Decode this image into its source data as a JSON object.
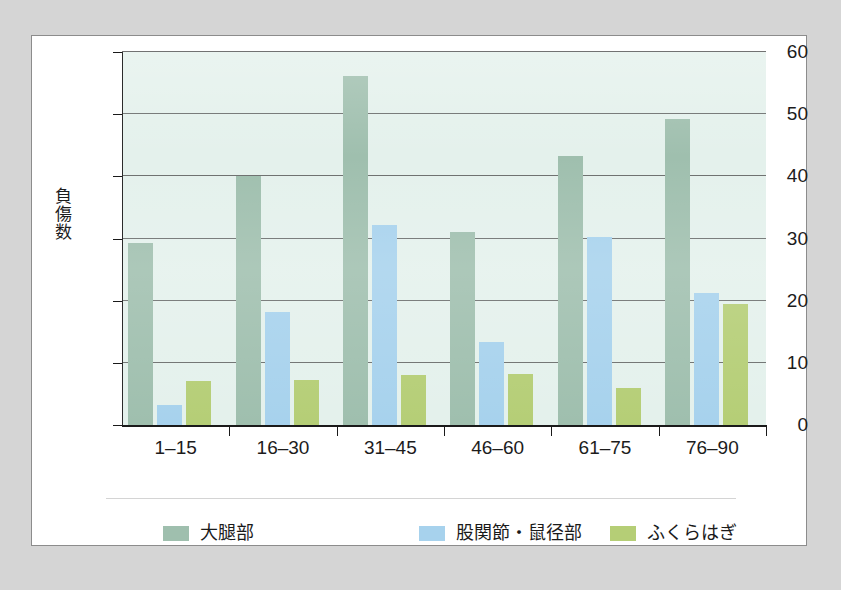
{
  "chart_data": {
    "type": "bar",
    "title": "",
    "xlabel": "",
    "ylabel": "負傷数",
    "categories": [
      "1–15",
      "16–30",
      "31–45",
      "46–60",
      "61–75",
      "76–90"
    ],
    "ylim": [
      0,
      60
    ],
    "y_ticks": [
      0,
      10,
      20,
      30,
      40,
      50,
      60
    ],
    "y_tick_labels": [
      "0",
      "10",
      "20",
      "30",
      "40",
      "50",
      "60"
    ],
    "grid": true,
    "legend_position": "bottom",
    "series": [
      {
        "name": "大腿部",
        "color": "#9fbfae",
        "values": [
          29.2,
          40.0,
          56.2,
          31.1,
          43.2,
          49.3
        ]
      },
      {
        "name": "股関節・鼠径部",
        "color": "#a7d2ed",
        "values": [
          3.2,
          18.2,
          32.1,
          13.3,
          30.3,
          21.2
        ]
      },
      {
        "name": "ふくらはぎ",
        "color": "#b5ce76",
        "values": [
          7.0,
          7.2,
          8.1,
          8.2,
          6.0,
          19.5
        ]
      }
    ]
  },
  "style": {
    "plot_background": "#e4f1ec",
    "card_background": "#ffffff",
    "page_background": "#d5d5d5",
    "grid_color": "#4a4a4a",
    "axis_color": "#1a1a1a",
    "text_color": "#1c1c1c"
  }
}
